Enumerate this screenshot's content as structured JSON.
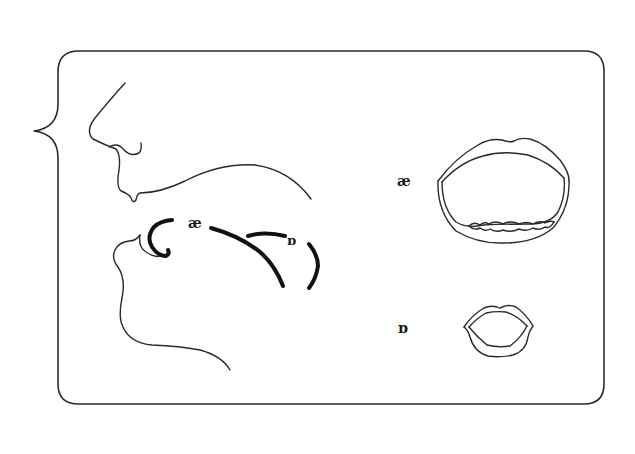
{
  "figure": {
    "type": "phonetics-diagram",
    "colors": {
      "stroke": "#2a2a2a",
      "background": "#ffffff"
    }
  },
  "sagittal_view": {
    "labels": [
      {
        "symbol": "æ",
        "x": 196,
        "y": 227
      },
      {
        "symbol": "ɒ",
        "x": 293,
        "y": 244
      }
    ]
  },
  "front_view": {
    "mouths": [
      {
        "symbol": "æ",
        "label_x": 405,
        "label_y": 186,
        "shape": "open-wide-with-teeth"
      },
      {
        "symbol": "ɒ",
        "label_x": 405,
        "label_y": 333,
        "shape": "rounded-small"
      }
    ]
  }
}
